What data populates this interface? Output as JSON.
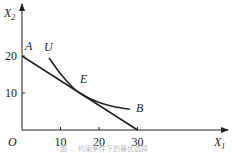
{
  "chart_data": {
    "type": "line",
    "title": "",
    "caption": "图 … 约束条件下的最优选择",
    "xlabel": "X1",
    "ylabel": "X2",
    "xlim": [
      0,
      50
    ],
    "ylim": [
      0,
      33
    ],
    "grid": false,
    "origin_label": "O",
    "xticks": [
      10,
      20,
      30
    ],
    "xtick_labels": [
      "10",
      "20",
      "30"
    ],
    "yticks": [
      10,
      20
    ],
    "ytick_labels": [
      "10",
      "20"
    ],
    "series": [
      {
        "name": "AB",
        "kind": "budget-line",
        "x": [
          0,
          30
        ],
        "y": [
          20,
          0
        ]
      },
      {
        "name": "U",
        "kind": "indifference-curve",
        "x": [
          7,
          10,
          13,
          15,
          18,
          21,
          24,
          28
        ],
        "y": [
          19.5,
          15.2,
          11.7,
          10,
          8.3,
          7.1,
          6.3,
          5.6
        ]
      }
    ],
    "annotations": [
      {
        "text": "A",
        "x": 0,
        "y": 20
      },
      {
        "text": "U",
        "x": 7,
        "y": 19.5
      },
      {
        "text": "E",
        "x": 15,
        "y": 10
      },
      {
        "text": "B",
        "x": 28,
        "y": 5.6
      }
    ]
  }
}
